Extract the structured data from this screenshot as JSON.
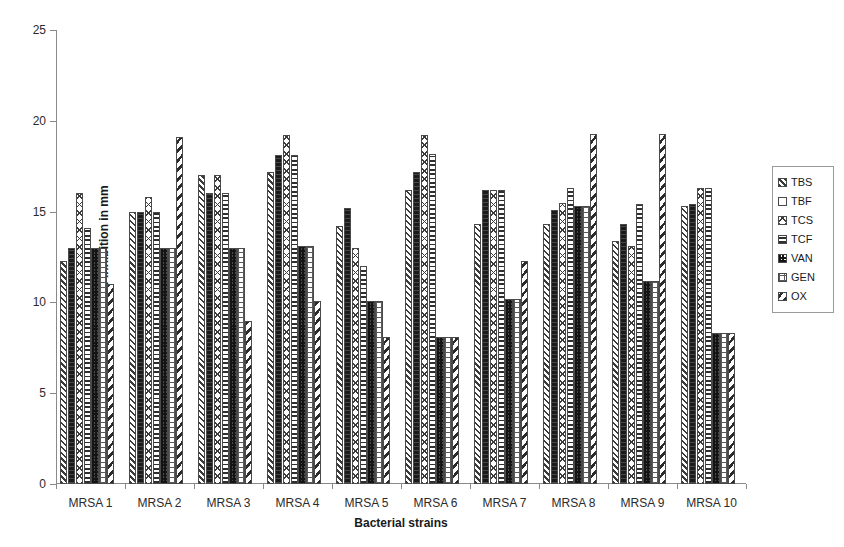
{
  "chart_data": {
    "type": "bar",
    "title": "",
    "xlabel": "Bacterial strains",
    "ylabel": "Zone of Inhibition in mm",
    "ylim": [
      0,
      25
    ],
    "yticks": [
      0,
      5,
      10,
      15,
      20,
      25
    ],
    "grid": false,
    "legend_position": "right",
    "categories": [
      "MRSA 1",
      "MRSA 2",
      "MRSA 3",
      "MRSA 4",
      "MRSA 5",
      "MRSA 6",
      "MRSA 7",
      "MRSA 8",
      "MRSA 9",
      "MRSA 10"
    ],
    "series": [
      {
        "name": "TBS",
        "pattern": "diagonal-hatch-right",
        "values": [
          12.3,
          15.0,
          17.0,
          17.2,
          14.2,
          16.2,
          14.3,
          14.3,
          13.4,
          15.3
        ]
      },
      {
        "name": "TBF",
        "pattern": "solid-black",
        "values": [
          13.0,
          15.0,
          16.0,
          18.1,
          15.2,
          17.2,
          16.2,
          15.1,
          14.3,
          15.4
        ]
      },
      {
        "name": "TCS",
        "pattern": "open-diamond",
        "values": [
          16.0,
          15.8,
          17.0,
          19.2,
          13.0,
          19.2,
          16.2,
          15.5,
          13.1,
          16.3
        ]
      },
      {
        "name": "TCF",
        "pattern": "horizontal-lines",
        "values": [
          14.1,
          15.0,
          16.0,
          18.1,
          12.0,
          18.2,
          16.2,
          16.3,
          15.4,
          16.3
        ]
      },
      {
        "name": "VAN",
        "pattern": "dark-checker",
        "values": [
          13.0,
          13.0,
          13.0,
          13.1,
          10.1,
          8.1,
          10.2,
          15.3,
          11.2,
          8.3
        ]
      },
      {
        "name": "GEN",
        "pattern": "light-dotted-grid",
        "values": [
          13.0,
          13.0,
          13.0,
          13.1,
          10.1,
          8.1,
          10.2,
          15.3,
          11.2,
          8.3
        ]
      },
      {
        "name": "OX",
        "pattern": "bold-diagonal-hatch-left",
        "values": [
          11.0,
          19.1,
          9.0,
          10.1,
          8.1,
          8.1,
          12.3,
          19.3,
          19.3,
          8.3
        ]
      }
    ]
  },
  "axes": {
    "y_label": "Zone of Inhibition in mm",
    "x_label": "Bacterial strains",
    "y_tick_labels": [
      "0",
      "5",
      "10",
      "15",
      "20",
      "25"
    ],
    "x_tick_labels": [
      "MRSA 1",
      "MRSA 2",
      "MRSA 3",
      "MRSA 4",
      "MRSA 5",
      "MRSA 6",
      "MRSA 7",
      "MRSA 8",
      "MRSA 9",
      "MRSA 10"
    ]
  },
  "legend": {
    "entries": [
      {
        "label": "TBS"
      },
      {
        "label": "TBF"
      },
      {
        "label": "TCS"
      },
      {
        "label": "TCF"
      },
      {
        "label": "VAN"
      },
      {
        "label": "GEN"
      },
      {
        "label": "OX"
      }
    ]
  },
  "style": {
    "axis_color": "#8a8a8a",
    "text_color": "#1a1a1a",
    "background": "#ffffff"
  }
}
